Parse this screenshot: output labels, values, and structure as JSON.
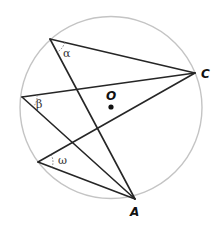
{
  "diagram": {
    "type": "inscribed-angles-in-circle",
    "circle": {
      "cx": 111,
      "cy": 107.5,
      "r": 91,
      "color": "#c4c4c4"
    },
    "center": {
      "label": "O",
      "x": 111,
      "y": 107
    },
    "points": {
      "C": {
        "label": "C",
        "x": 195,
        "y": 73
      },
      "A": {
        "label": "A",
        "x": 135,
        "y": 199
      }
    },
    "vertices": [
      {
        "id": "alpha",
        "x": 50,
        "y": 39,
        "angle_label": "α"
      },
      {
        "id": "beta",
        "x": 22,
        "y": 97,
        "angle_label": "β"
      },
      {
        "id": "omega",
        "x": 38,
        "y": 162,
        "angle_label": "ω"
      }
    ],
    "labels": {
      "alpha": "α",
      "beta": "β",
      "omega": "ω",
      "O": "O",
      "C": "C",
      "A": "A"
    },
    "line_color": "#262626"
  }
}
